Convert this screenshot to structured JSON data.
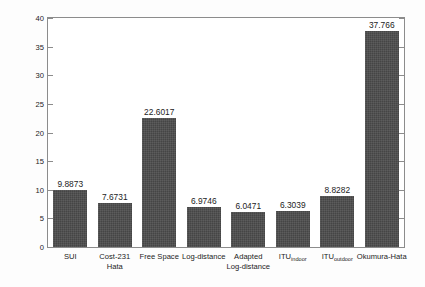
{
  "chart_data": {
    "type": "bar",
    "title": "",
    "subtitle": "",
    "xlabel": "",
    "ylabel": "Root Mean Square Error [dB]",
    "ylim": [
      0,
      40
    ],
    "ytick_values": [
      0,
      5,
      10,
      15,
      20,
      25,
      30,
      35,
      40
    ],
    "ytick_labels": [
      "0",
      "5",
      "10",
      "15",
      "20",
      "25",
      "30",
      "35",
      "40"
    ],
    "grid": false,
    "legend": null,
    "bar_color": "#4c4c4c",
    "axis_color": "#8c8c8c",
    "background_color": "#ffffff",
    "categories": [
      "SUI",
      "Cost-231 Hata",
      "Free Space",
      "Log-distance",
      "Adapted Log-distance",
      "ITU_indoor",
      "ITU_outdoor",
      "Okumura-Hata"
    ],
    "category_labels": [
      {
        "line1": "SUI",
        "line2": "",
        "sub": ""
      },
      {
        "line1": "Cost-231",
        "line2": "Hata",
        "sub": ""
      },
      {
        "line1": "Free Space",
        "line2": "",
        "sub": ""
      },
      {
        "line1": "Log-distance",
        "line2": "",
        "sub": ""
      },
      {
        "line1": "Adapted",
        "line2": "Log-distance",
        "sub": ""
      },
      {
        "line1": "ITU",
        "line2": "",
        "sub": "indoor"
      },
      {
        "line1": "ITU",
        "line2": "",
        "sub": "outdoor"
      },
      {
        "line1": "Okumura-Hata",
        "line2": "",
        "sub": ""
      }
    ],
    "values": [
      9.8873,
      7.6731,
      22.6017,
      6.9746,
      6.0471,
      6.3039,
      8.8282,
      37.766
    ],
    "value_labels": [
      "9.8873",
      "7.6731",
      "22.6017",
      "6.9746",
      "6.0471",
      "6.3039",
      "8.8282",
      "37.766"
    ]
  }
}
